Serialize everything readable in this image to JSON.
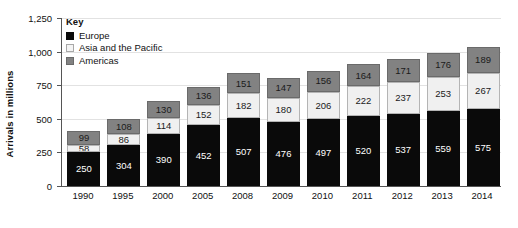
{
  "chart_data": {
    "type": "bar",
    "subtype": "stacked-bar",
    "title": "",
    "xlabel": "",
    "ylabel": "Arrivals in millions",
    "ylim": [
      0,
      1250
    ],
    "yticks": [
      "0",
      "250",
      "500",
      "750",
      "1,000",
      "1,250"
    ],
    "ytick_values": [
      0,
      250,
      500,
      750,
      1000,
      1250
    ],
    "grid": true,
    "legend_position": "top-left",
    "legend_title": "Key",
    "categories": [
      "1990",
      "1995",
      "2000",
      "2005",
      "2008",
      "2009",
      "2010",
      "2011",
      "2012",
      "2013",
      "2014"
    ],
    "series": [
      {
        "name": "Europe",
        "color": "#0a0a0a",
        "values": [
          250,
          304,
          390,
          452,
          507,
          476,
          497,
          520,
          537,
          559,
          575
        ]
      },
      {
        "name": "Asia and the Pacific",
        "color": "#f0f0f0",
        "values": [
          58,
          86,
          114,
          152,
          182,
          180,
          206,
          222,
          237,
          253,
          267
        ]
      },
      {
        "name": "Americas",
        "color": "#828282",
        "values": [
          99,
          108,
          130,
          136,
          151,
          147,
          156,
          164,
          171,
          176,
          189
        ]
      }
    ]
  }
}
